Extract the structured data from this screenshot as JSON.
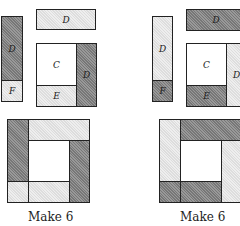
{
  "left": {
    "strip": {
      "d": "D",
      "f": "F"
    },
    "top_bar": "D",
    "block": {
      "c": "C",
      "e": "E",
      "d": "D"
    },
    "caption": "Make 6"
  },
  "right": {
    "strip": {
      "d": "D",
      "f": "F"
    },
    "top_bar": "D",
    "block": {
      "c": "C",
      "e": "E",
      "d": "D"
    },
    "caption": "Make 6"
  }
}
